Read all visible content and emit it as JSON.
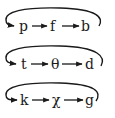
{
  "diagram": {
    "type": "cycle-chains",
    "colors": {
      "stroke": "#1a1a1a",
      "background": "#ffffff"
    },
    "cycles": [
      {
        "nodes": [
          "p",
          "f",
          "b"
        ]
      },
      {
        "nodes": [
          "t",
          "θ",
          "d"
        ]
      },
      {
        "nodes": [
          "k",
          "χ",
          "g"
        ]
      }
    ]
  }
}
